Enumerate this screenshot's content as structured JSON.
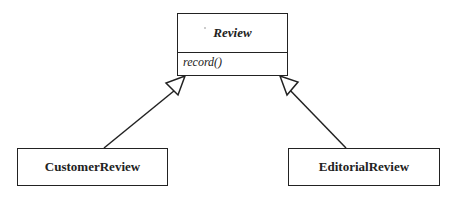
{
  "diagram": {
    "type": "UML class diagram",
    "classes": [
      {
        "id": "review",
        "name": "Review",
        "abstract": true,
        "operations": [
          "record()"
        ]
      },
      {
        "id": "customer",
        "name": "CustomerReview"
      },
      {
        "id": "editorial",
        "name": "EditorialReview"
      }
    ],
    "relations": [
      {
        "from": "customer",
        "to": "review",
        "kind": "generalization"
      },
      {
        "from": "editorial",
        "to": "review",
        "kind": "generalization"
      }
    ]
  }
}
